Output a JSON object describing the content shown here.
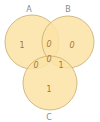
{
  "diagram": {
    "type": "venn",
    "fill_color": "#fbe3a6",
    "stroke_color": "#c9ab6c",
    "sets": [
      {
        "id": "A",
        "label": "A",
        "only": "1"
      },
      {
        "id": "B",
        "label": "B",
        "only": "0"
      },
      {
        "id": "C",
        "label": "C",
        "only": "1"
      }
    ],
    "regions": {
      "A_only": "1",
      "B_only": "0",
      "C_only": "1",
      "A_and_B": "0",
      "A_and_C": "0",
      "B_and_C": "1",
      "A_and_B_and_C": "0"
    }
  }
}
